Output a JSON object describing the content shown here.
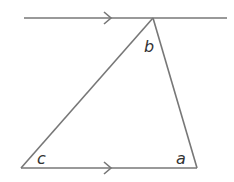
{
  "diagram": {
    "type": "parallel-lines-triangle",
    "colors": {
      "line": "#777777",
      "text": "#333333",
      "background": "#ffffff"
    },
    "labels": {
      "a": "a",
      "b": "b",
      "c": "c"
    },
    "arrows": {
      "top": "parallel-marker",
      "bottom": "parallel-marker"
    }
  }
}
